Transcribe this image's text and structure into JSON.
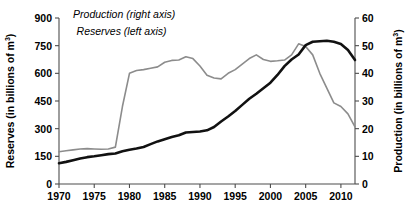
{
  "chart_data": {
    "type": "line",
    "title": "",
    "xlabel": "",
    "ylabel": "Reserves (in billions of m3)",
    "y2label": "Production (in billions of m3)",
    "xlim": [
      1970,
      2012
    ],
    "ylim": [
      0,
      900
    ],
    "y2lim": [
      0,
      60
    ],
    "grid": false,
    "legend_position": "inline-annotations",
    "x_ticks": [
      1970,
      1975,
      1980,
      1985,
      1990,
      1995,
      2000,
      2005,
      2010
    ],
    "y_ticks": [
      0,
      150,
      300,
      450,
      600,
      750,
      900
    ],
    "y2_ticks": [
      0,
      10,
      20,
      30,
      40,
      50,
      60
    ],
    "annotations": [
      {
        "text": "Reserves (left axis)",
        "x": 1972.5,
        "y": 810
      },
      {
        "text": "Production (right axis)",
        "x": 1972.0,
        "y": 60
      }
    ],
    "series": [
      {
        "name": "Reserves (left axis)",
        "axis": "left",
        "color": "#8c8c8c",
        "units": "billions of m3",
        "x": [
          1970,
          1971,
          1972,
          1973,
          1974,
          1975,
          1976,
          1977,
          1978,
          1979,
          1980,
          1981,
          1982,
          1983,
          1984,
          1985,
          1986,
          1987,
          1988,
          1989,
          1990,
          1991,
          1992,
          1993,
          1994,
          1995,
          1996,
          1997,
          1998,
          1999,
          2000,
          2001,
          2002,
          2003,
          2004,
          2005,
          2006,
          2007,
          2008,
          2009,
          2010,
          2011,
          2012
        ],
        "y": [
          175,
          180,
          185,
          190,
          192,
          190,
          188,
          190,
          200,
          420,
          600,
          615,
          620,
          628,
          635,
          660,
          670,
          672,
          690,
          680,
          640,
          590,
          575,
          570,
          600,
          620,
          650,
          680,
          700,
          675,
          665,
          668,
          672,
          700,
          760,
          745,
          700,
          600,
          520,
          440,
          420,
          380,
          310
        ]
      },
      {
        "name": "Production (right axis)",
        "axis": "right",
        "color": "#111111",
        "units": "billions of m3",
        "x": [
          1970,
          1971,
          1972,
          1973,
          1974,
          1975,
          1976,
          1977,
          1978,
          1979,
          1980,
          1981,
          1982,
          1983,
          1984,
          1985,
          1986,
          1987,
          1988,
          1989,
          1990,
          1991,
          1992,
          1993,
          1994,
          1995,
          1996,
          1997,
          1998,
          1999,
          2000,
          2001,
          2002,
          2003,
          2004,
          2005,
          2006,
          2007,
          2008,
          2009,
          2010,
          2011,
          2012
        ],
        "y": [
          7.5,
          8.0,
          8.6,
          9.2,
          9.7,
          10.0,
          10.4,
          10.8,
          11.0,
          11.8,
          12.4,
          12.8,
          13.4,
          14.4,
          15.4,
          16.2,
          17.0,
          17.6,
          18.6,
          18.8,
          19.0,
          19.4,
          20.6,
          22.6,
          24.4,
          26.4,
          28.6,
          30.8,
          32.6,
          34.6,
          36.6,
          39.4,
          42.6,
          45.0,
          46.8,
          50.2,
          51.4,
          51.6,
          51.8,
          51.4,
          50.6,
          48.4,
          44.8
        ]
      }
    ]
  },
  "axes": {
    "left": {
      "label_main": "Reserves (in billions of m",
      "label_sup": "3",
      "label_tail": ")"
    },
    "right": {
      "label_main": "Production (in billions of m",
      "label_sup": "3",
      "label_tail": ")"
    }
  }
}
